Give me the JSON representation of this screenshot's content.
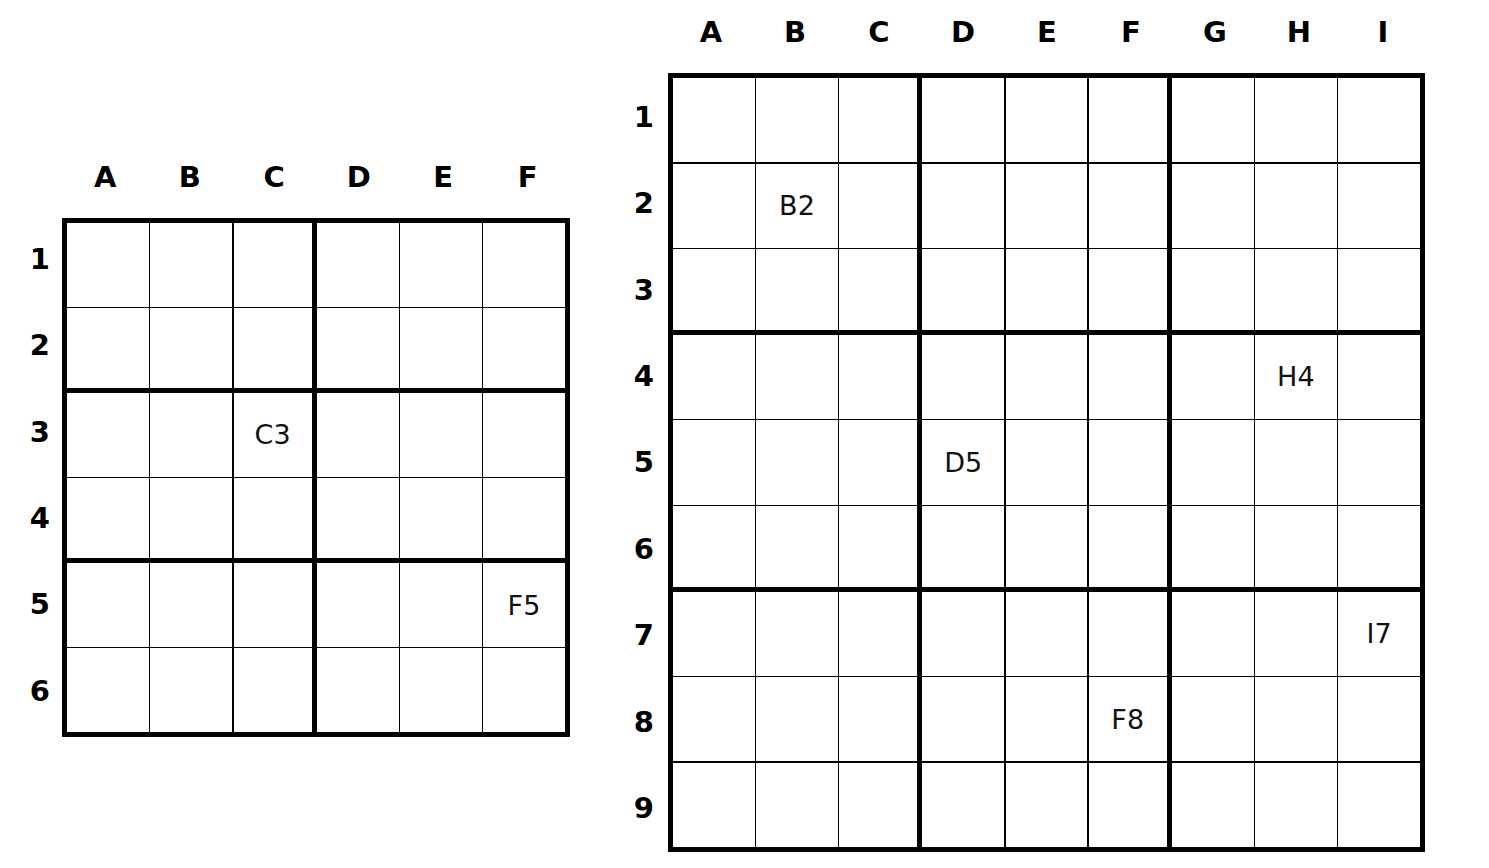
{
  "page": {
    "background_color": "#ffffff",
    "line_color": "#000000",
    "text_color": "#000000"
  },
  "grids": [
    {
      "id": "left-grid",
      "name": "6x6 sudoku coordinate grid",
      "columns": 6,
      "rows": 9,
      "column_headers": [
        "A",
        "B",
        "C",
        "D",
        "E",
        "F"
      ],
      "row_headers": [
        "1",
        "2",
        "3",
        "4",
        "5",
        "6"
      ],
      "box_width": 3,
      "box_height": 2,
      "cells": [
        [
          "",
          "",
          "",
          "",
          "",
          ""
        ],
        [
          "",
          "",
          "",
          "",
          "",
          ""
        ],
        [
          "",
          "",
          "C3",
          "",
          "",
          ""
        ],
        [
          "",
          "",
          "",
          "",
          "",
          ""
        ],
        [
          "",
          "",
          "",
          "",
          "",
          "F5"
        ],
        [
          "",
          "",
          "",
          "",
          "",
          ""
        ]
      ],
      "filled_labels": [
        "C3",
        "F5"
      ]
    },
    {
      "id": "right-grid",
      "name": "9x9 sudoku coordinate grid",
      "columns": 9,
      "rows": 9,
      "column_headers": [
        "A",
        "B",
        "C",
        "D",
        "E",
        "F",
        "G",
        "H",
        "I"
      ],
      "row_headers": [
        "1",
        "2",
        "3",
        "4",
        "5",
        "6",
        "7",
        "8",
        "9"
      ],
      "box_width": 3,
      "box_height": 3,
      "cells": [
        [
          "",
          "",
          "",
          "",
          "",
          "",
          "",
          "",
          ""
        ],
        [
          "",
          "B2",
          "",
          "",
          "",
          "",
          "",
          "",
          ""
        ],
        [
          "",
          "",
          "",
          "",
          "",
          "",
          "",
          "",
          ""
        ],
        [
          "",
          "",
          "",
          "",
          "",
          "",
          "",
          "H4",
          ""
        ],
        [
          "",
          "",
          "",
          "D5",
          "",
          "",
          "",
          "",
          ""
        ],
        [
          "",
          "",
          "",
          "",
          "",
          "",
          "",
          "",
          ""
        ],
        [
          "",
          "",
          "",
          "",
          "",
          "",
          "",
          "",
          "I7"
        ],
        [
          "",
          "",
          "",
          "",
          "",
          "F8",
          "",
          "",
          ""
        ],
        [
          "",
          "",
          "",
          "",
          "",
          "",
          "",
          "",
          ""
        ]
      ],
      "filled_labels": [
        "B2",
        "H4",
        "D5",
        "I7",
        "F8"
      ]
    }
  ]
}
